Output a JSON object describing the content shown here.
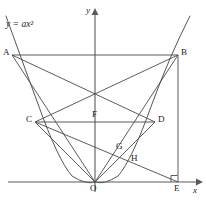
{
  "figure": {
    "curve_equation": {
      "lhs": "y",
      "equals": "=",
      "coefficient": "a",
      "variable": "x",
      "exponent": "2",
      "full_text": "y = ax²"
    },
    "axes": {
      "x_label": "x",
      "y_label": "y",
      "origin_label": "O",
      "x_axis_y_px": 182,
      "x_axis_from_px": 8,
      "x_axis_to_px": 198,
      "y_axis_x_px": 95,
      "y_axis_from_px": 10,
      "y_axis_to_px": 192
    },
    "points": [
      {
        "id": "A",
        "label": "A",
        "x": 12,
        "y": 55,
        "label_dx": -9,
        "label_dy": -4
      },
      {
        "id": "B",
        "label": "B",
        "x": 178,
        "y": 55,
        "label_dx": 3,
        "label_dy": -4
      },
      {
        "id": "C",
        "label": "C",
        "x": 35,
        "y": 122,
        "label_dx": -9,
        "label_dy": -4
      },
      {
        "id": "D",
        "label": "D",
        "x": 155,
        "y": 122,
        "label_dx": 3,
        "label_dy": -4
      },
      {
        "id": "F",
        "label": "F",
        "x": 95,
        "y": 122,
        "label_dx": -3,
        "label_dy": -11
      },
      {
        "id": "G",
        "label": "G",
        "x": 124,
        "y": 147,
        "label_dx": -8,
        "label_dy": -3
      },
      {
        "id": "H",
        "label": "H",
        "x": 134,
        "y": 157,
        "label_dx": -2,
        "label_dy": 1
      },
      {
        "id": "O",
        "label": "O",
        "x": 95,
        "y": 182,
        "label_dx": -3,
        "label_dy": 3
      },
      {
        "id": "E",
        "label": "E",
        "x": 178,
        "y": 182,
        "label_dx": -3,
        "label_dy": 3
      }
    ],
    "segments": [
      {
        "name": "segment-AB",
        "from": "A",
        "to": "B"
      },
      {
        "name": "segment-CD",
        "from": "C",
        "to": "D"
      },
      {
        "name": "segment-BE",
        "from": "B",
        "to": "E"
      },
      {
        "name": "segment-OA",
        "from": "O",
        "to": "A"
      },
      {
        "name": "segment-OB",
        "from": "O",
        "to": "B"
      },
      {
        "name": "segment-OC",
        "from": "O",
        "to": "C"
      },
      {
        "name": "segment-OD",
        "from": "O",
        "to": "D"
      },
      {
        "name": "segment-AD",
        "from": "A",
        "to": "D"
      },
      {
        "name": "segment-BC",
        "from": "B",
        "to": "C"
      },
      {
        "name": "segment-CE",
        "from": "C",
        "to": "E"
      }
    ],
    "right_angle_marker": {
      "name": "right-angle-at-E",
      "at": "E",
      "size_px": 6
    },
    "parabola": {
      "name": "parabola-curve",
      "vertex_x": 95,
      "vertex_y": 182,
      "left_end_x": 6,
      "right_end_x": 190,
      "top_y": 16,
      "passes_through": [
        "A",
        "B",
        "O"
      ]
    },
    "colors": {
      "stroke": "#4a4a4a",
      "axis": "#5a5a5a",
      "curve": "#555555",
      "text": "#1a1a1a",
      "background": "#ffffff"
    }
  }
}
